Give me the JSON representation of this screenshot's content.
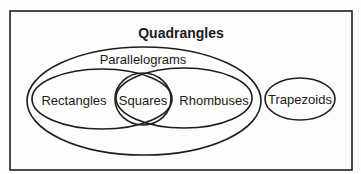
{
  "diagram": {
    "title": "Quadrangles",
    "sets": {
      "parallelograms": "Parallelograms",
      "rectangles": "Rectangles",
      "squares": "Squares",
      "rhombuses": "Rhombuses",
      "trapezoids": "Trapezoids"
    },
    "relationships": [
      {
        "set": "Parallelograms",
        "within": "Quadrangles"
      },
      {
        "set": "Rectangles",
        "within": "Parallelograms"
      },
      {
        "set": "Rhombuses",
        "within": "Parallelograms"
      },
      {
        "set": "Squares",
        "within": "Rectangles ∩ Rhombuses"
      },
      {
        "set": "Trapezoids",
        "within": "Quadrangles",
        "disjoint_from": "Parallelograms"
      }
    ],
    "colors": {
      "stroke": "#1e1e1e",
      "background": "#fdfdfb",
      "text": "#1a1a1a"
    }
  }
}
